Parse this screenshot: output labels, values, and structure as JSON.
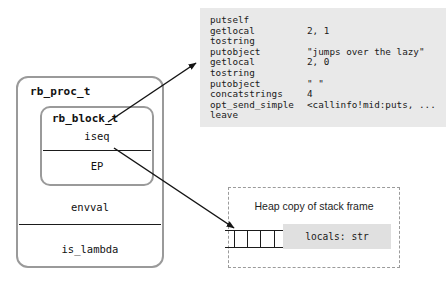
{
  "struct": {
    "outer_label": "rb_proc_t",
    "inner_label": "rb_block_t",
    "inner_fields": [
      "iseq",
      "EP"
    ],
    "outer_fields": [
      "envval",
      "is_lambda"
    ]
  },
  "bytecode": {
    "lines": [
      {
        "op": "putself",
        "arg": ""
      },
      {
        "op": "getlocal",
        "arg": "2, 1"
      },
      {
        "op": "tostring",
        "arg": ""
      },
      {
        "op": "putobject",
        "arg": "\"jumps over the lazy\""
      },
      {
        "op": "getlocal",
        "arg": "2, 0"
      },
      {
        "op": "tostring",
        "arg": ""
      },
      {
        "op": "putobject",
        "arg": "\" \""
      },
      {
        "op": "concatstrings",
        "arg": "4"
      },
      {
        "op": "opt_send_simple",
        "arg": "<callinfo!mid:puts, ..."
      },
      {
        "op": "leave",
        "arg": ""
      }
    ]
  },
  "heap": {
    "title": "Heap copy of stack frame",
    "cells": [
      "",
      "",
      ""
    ],
    "locals_label": "locals: str"
  },
  "colors": {
    "code_bg": "#e9e9e9",
    "chip_bg": "#e0e0e0",
    "struct_border": "#9a9a9a",
    "rule": "#1b1b1b",
    "dashed_border": "#9b9b9b",
    "arrow": "#141414"
  }
}
